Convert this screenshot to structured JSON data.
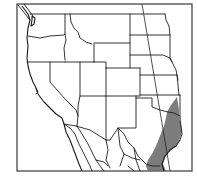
{
  "map": {
    "title": "Range map — western North America",
    "region": "Western United States and northern Mexico",
    "range_color": "#6e6e6e",
    "frame_color": "#3a3a3a",
    "border_color": "#1e1e1e",
    "background_color": "#ffffff",
    "shaded_region": "Central and south Texas into northeastern Mexico",
    "legend": []
  }
}
